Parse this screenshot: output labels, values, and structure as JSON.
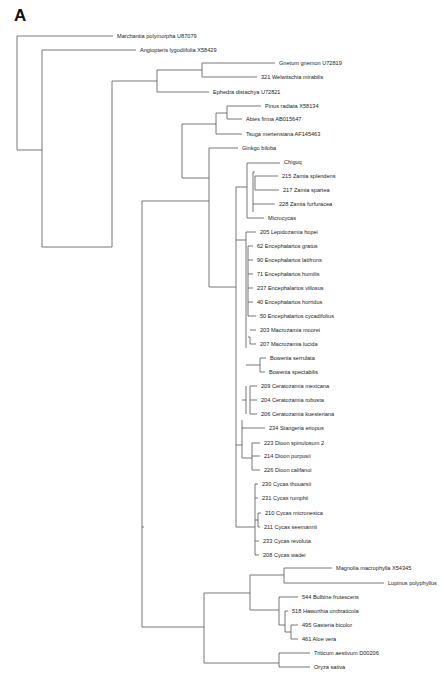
{
  "figure": {
    "panel_label": "A",
    "footer_text": "",
    "line_color": "#555555",
    "taxa": [
      {
        "id": "marchantia",
        "label": "Marchantia polymorpha U87079",
        "x": 115,
        "y": 36
      },
      {
        "id": "angiopteris",
        "label": "Angiopteris lygodiifolia X58429",
        "x": 138,
        "y": 50
      },
      {
        "id": "gnetum",
        "label": "Gnetum gnemon U72819",
        "x": 277,
        "y": 63
      },
      {
        "id": "welwitschia",
        "label": "321 Welwitschia mirabilis",
        "x": 259,
        "y": 77
      },
      {
        "id": "ephedra",
        "label": "Ephedra distachya U72821",
        "x": 211,
        "y": 92
      },
      {
        "id": "pinus",
        "label": "Pinus radiata X58134",
        "x": 263,
        "y": 106
      },
      {
        "id": "abies",
        "label": "Abies firma AB015647",
        "x": 244,
        "y": 119
      },
      {
        "id": "tsuga",
        "label": "Tsuga mertensiana AF145463",
        "x": 244,
        "y": 134
      },
      {
        "id": "ginkgo",
        "label": "Ginkgo biloba",
        "x": 240,
        "y": 148
      },
      {
        "id": "chiguq",
        "label": "Chiguq",
        "x": 282,
        "y": 162
      },
      {
        "id": "z215",
        "label": "215 Zamia splendens",
        "x": 280,
        "y": 176
      },
      {
        "id": "z217",
        "label": "217 Zamia spartea",
        "x": 281,
        "y": 190
      },
      {
        "id": "z228",
        "label": "228 Zamia furfuracea",
        "x": 277,
        "y": 204
      },
      {
        "id": "microcycas",
        "label": "Microcycas",
        "x": 266,
        "y": 218
      },
      {
        "id": "l205",
        "label": "205 Lepidozamia hopei",
        "x": 258,
        "y": 232
      },
      {
        "id": "e62",
        "label": "62 Encephalartos gratus",
        "x": 255,
        "y": 246
      },
      {
        "id": "e90",
        "label": "90 Encephalartos latifrons",
        "x": 255,
        "y": 260
      },
      {
        "id": "e71",
        "label": "71 Encephalartos humilis",
        "x": 255,
        "y": 274
      },
      {
        "id": "e237",
        "label": "237 Encephalartos villosus",
        "x": 255,
        "y": 288
      },
      {
        "id": "e40",
        "label": "40 Encephalartos horridus",
        "x": 255,
        "y": 302
      },
      {
        "id": "e50",
        "label": "50 Encephalartos cycadifolius",
        "x": 258,
        "y": 316
      },
      {
        "id": "m203",
        "label": "203 Macrozamia moorei",
        "x": 258,
        "y": 330
      },
      {
        "id": "m207",
        "label": "207 Macrozamia lucida",
        "x": 258,
        "y": 344
      },
      {
        "id": "bserr",
        "label": "Bowenia serrulata",
        "x": 268,
        "y": 358
      },
      {
        "id": "bspec",
        "label": "Bowenia spectabilis",
        "x": 267,
        "y": 372
      },
      {
        "id": "c209",
        "label": "209 Ceratozamia mexicana",
        "x": 259,
        "y": 386
      },
      {
        "id": "c204",
        "label": "204 Ceratozamia robusta",
        "x": 259,
        "y": 400
      },
      {
        "id": "c206",
        "label": "206 Ceratozamia kuesteriana",
        "x": 259,
        "y": 414
      },
      {
        "id": "s234",
        "label": "234 Stangeria eriopus",
        "x": 267,
        "y": 428
      },
      {
        "id": "d223",
        "label": "223 Dioon spinulosum 2",
        "x": 262,
        "y": 443
      },
      {
        "id": "d214",
        "label": "214 Dioon purpusii",
        "x": 262,
        "y": 456
      },
      {
        "id": "d226",
        "label": "226 Dioon califanoi",
        "x": 262,
        "y": 470
      },
      {
        "id": "cy230",
        "label": "230 Cycas thouarsii",
        "x": 260,
        "y": 484
      },
      {
        "id": "cy231",
        "label": "231 Cycas rumphii",
        "x": 260,
        "y": 498
      },
      {
        "id": "cy210",
        "label": "210 Cycas micronesica",
        "x": 263,
        "y": 513
      },
      {
        "id": "cy211",
        "label": "211 Cycas seemannii",
        "x": 262,
        "y": 527
      },
      {
        "id": "cy233",
        "label": "233 Cycas revoluta",
        "x": 261,
        "y": 541
      },
      {
        "id": "cy208",
        "label": "208 Cycas wadei",
        "x": 261,
        "y": 555
      },
      {
        "id": "magnolia",
        "label": "Magnolia macrophylla X54345",
        "x": 334,
        "y": 568
      },
      {
        "id": "lupinus",
        "label": "Lupinus polyphyllus",
        "x": 386,
        "y": 583
      },
      {
        "id": "bulbine",
        "label": "544 Bulbine frutescens",
        "x": 300,
        "y": 597
      },
      {
        "id": "haworthia",
        "label": "518 Haworthia umbraticola",
        "x": 290,
        "y": 611
      },
      {
        "id": "gasteria",
        "label": "495 Gasteria bicolor",
        "x": 300,
        "y": 625
      },
      {
        "id": "aloe",
        "label": "461 Aloe vera",
        "x": 300,
        "y": 639
      },
      {
        "id": "triticum",
        "label": "Triticum aestivum D00206",
        "x": 312,
        "y": 653
      },
      {
        "id": "oryza",
        "label": "Oryza sativa",
        "x": 312,
        "y": 667
      }
    ],
    "branches": [
      "M17,36 H113",
      "M17,36 V150 H42",
      "M42,50 H136",
      "M42,50 V247 H112",
      "M112,81 V247",
      "M112,81 H157",
      "M157,70 V92",
      "M157,70 H202",
      "M202,63 V77",
      "M202,63 H275",
      "M202,77 H257",
      "M157,92 H209",
      "M182,124 V178",
      "M182,124 H216",
      "M216,113 V134",
      "M216,113 H227",
      "M227,106 V119",
      "M227,106 H261",
      "M227,119 H242",
      "M216,134 H242",
      "M182,178 H209",
      "M209,148 V170",
      "M209,148 H238",
      "M142,201 V527",
      "M142,201 H209",
      "M209,170 V287",
      "M236,187 V287",
      "M209,287 H236",
      "M236,187 H247",
      "M247,163 V218",
      "M247,163 H280",
      "M253,172 V212",
      "M253,172 H255",
      "M255,176 V190",
      "M255,176 H278",
      "M255,190 H279",
      "M253,204 H275",
      "M247,218 H264",
      "M236,240 H246",
      "M246,232 V348",
      "M246,232 H256",
      "M248,246 V316",
      "M248,246 H253",
      "M248,260 H253",
      "M248,274 H253",
      "M248,288 H253",
      "M248,302 H253",
      "M248,316 H256",
      "M250,337 V344",
      "M250,330 H256",
      "M250,344 H256",
      "M250,337 H248",
      "M252,365 H260",
      "M260,358 V372",
      "M260,358 H266",
      "M260,372 H265",
      "M246,365 H252",
      "M242,420 V445",
      "M242,445 H236",
      "M246,400 H242",
      "M250,386 V414",
      "M246,386 V414",
      "M250,386 H257",
      "M250,400 H257",
      "M250,414 H257",
      "M242,428 H265",
      "M242,445 V458",
      "M242,458 H252",
      "M252,443 V470",
      "M252,443 H260",
      "M252,456 H260",
      "M252,470 H260",
      "M236,287 V527",
      "M236,527 H255",
      "M255,484 V555",
      "M255,484 H258",
      "M255,498 H258",
      "M255,541 H259",
      "M255,555 H259",
      "M258,513 V527",
      "M258,513 H261",
      "M258,527 H260",
      "M255,520 H258",
      "M142,527 H144",
      "M142,527 V627 H204",
      "M204,593 V663",
      "M204,593 H250",
      "M250,575 V610",
      "M250,575 H284",
      "M284,568 V583",
      "M284,568 H332",
      "M284,583 H384",
      "M250,610 H279",
      "M279,597 V625",
      "M279,597 H298",
      "M285,611 V632",
      "M279,625 H285",
      "M285,611 H288",
      "M291,625 V639",
      "M285,632 H291",
      "M291,625 H298",
      "M291,639 H298",
      "M204,663 H279",
      "M279,653 V667",
      "M279,653 H310",
      "M279,667 H310"
    ]
  }
}
